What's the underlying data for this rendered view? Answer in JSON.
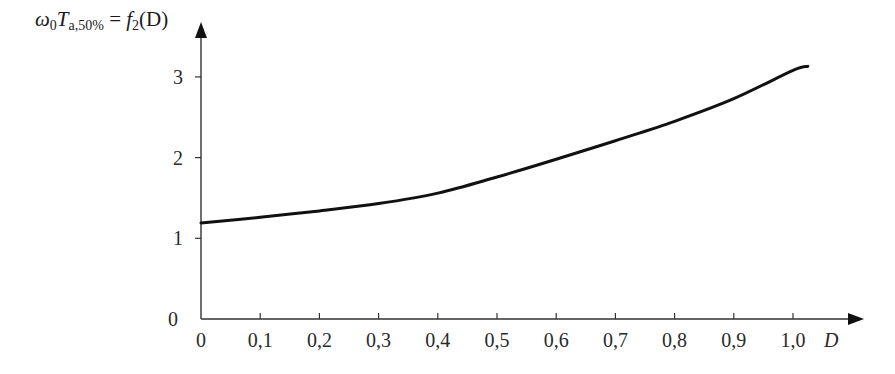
{
  "chart_data": {
    "type": "line",
    "title": "",
    "ylabel": "ω0 Ta,50% = f2(D)",
    "ylabel_parts": {
      "omega": "ω",
      "omega_sub": "0",
      "T": "T",
      "T_sub": "a,50%",
      "eq": " = ",
      "f": "f",
      "f_sub": "2",
      "arg": "(D)"
    },
    "xlabel": "D",
    "xlim": [
      0,
      1.08
    ],
    "ylim": [
      0,
      3.5
    ],
    "grid": false,
    "legend": null,
    "x_ticks": [
      "0",
      "0,1",
      "0,2",
      "0,3",
      "0,4",
      "0,5",
      "0,6",
      "0,7",
      "0,8",
      "0,9",
      "1,0"
    ],
    "x_tick_values": [
      0,
      0.1,
      0.2,
      0.3,
      0.4,
      0.5,
      0.6,
      0.7,
      0.8,
      0.9,
      1.0
    ],
    "y_ticks": [
      "0",
      "1",
      "2",
      "3"
    ],
    "y_tick_values": [
      0,
      1,
      2,
      3
    ],
    "series": [
      {
        "name": "f2(D)",
        "color": "#111111",
        "x": [
          0,
          0.1,
          0.2,
          0.3,
          0.4,
          0.5,
          0.6,
          0.7,
          0.8,
          0.9,
          1.0,
          1.025
        ],
        "y": [
          1.19,
          1.26,
          1.34,
          1.43,
          1.56,
          1.76,
          1.98,
          2.21,
          2.45,
          2.73,
          3.08,
          3.13
        ]
      }
    ]
  }
}
